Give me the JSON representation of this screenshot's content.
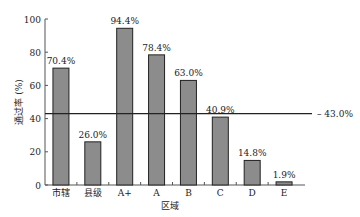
{
  "chart_data": {
    "type": "bar",
    "title": "",
    "xlabel": "区域",
    "ylabel": "通过率 (%)",
    "ylim": [
      0,
      100
    ],
    "yticks": [
      0,
      20,
      40,
      60,
      80,
      100
    ],
    "categories": [
      "市辖",
      "县级",
      "A+",
      "A",
      "B",
      "C",
      "D",
      "E"
    ],
    "values": [
      70.4,
      26.0,
      94.4,
      78.4,
      63.0,
      40.9,
      14.8,
      1.9
    ],
    "data_labels": [
      "70.4%",
      "26.0%",
      "94.4%",
      "78.4%",
      "63.0%",
      "40.9%",
      "14.8%",
      "1.9%"
    ],
    "reference_line": {
      "value": 43.0,
      "label": "43.0%"
    },
    "bar_color": "#8c8c8c",
    "grid": false,
    "legend": "none"
  }
}
